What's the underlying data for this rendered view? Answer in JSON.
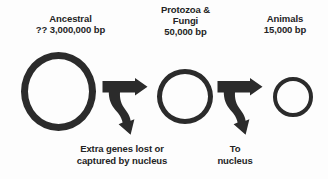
{
  "figure": {
    "background_color": "#fdfdfd",
    "ink_color": "#2b2b2b"
  },
  "stages": [
    {
      "id": "ancestral",
      "name": "Ancestral",
      "size": "?? 3,000,000 bp",
      "circle": {
        "diameter_px": 75,
        "stroke_px": 7
      }
    },
    {
      "id": "protozoa-fungi",
      "name_line_1": "Protozoa &",
      "name_line_2": "Fungi",
      "size": "50,000 bp",
      "circle": {
        "diameter_px": 56,
        "stroke_px": 5.5
      }
    },
    {
      "id": "animals",
      "name": "Animals",
      "size": "15,000 bp",
      "circle": {
        "diameter_px": 40,
        "stroke_px": 4.5
      }
    }
  ],
  "transitions": [
    {
      "id": "transition-one",
      "arrow_icon": "fork-arrow-icon",
      "caption_line_1": "Extra genes lost or",
      "caption_line_2": "captured by nucleus"
    },
    {
      "id": "transition-two",
      "arrow_icon": "fork-arrow-icon",
      "caption_line_1": "To",
      "caption_line_2": "nucleus"
    }
  ]
}
